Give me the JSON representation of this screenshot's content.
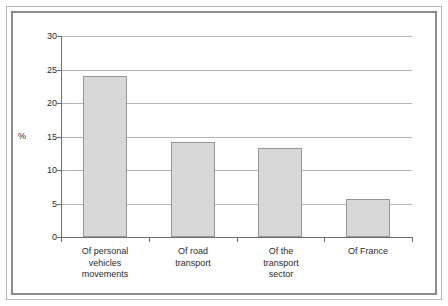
{
  "chart_data": {
    "type": "bar",
    "title": "",
    "subtitle": "",
    "xlabel": "",
    "ylabel": "%",
    "categories": [
      "Of personal vehicles movements",
      "Of road transport",
      "Of the transport sector",
      "Of France"
    ],
    "category_lines": [
      [
        "Of personal",
        "vehicles",
        "movements"
      ],
      [
        "Of road",
        "transport"
      ],
      [
        "Of the",
        "transport",
        "sector"
      ],
      [
        "Of France"
      ]
    ],
    "values": [
      24.0,
      14.2,
      13.3,
      5.6
    ],
    "ylim": [
      0,
      30
    ],
    "ytick_values": [
      0,
      5,
      10,
      15,
      20,
      25,
      30
    ],
    "ytick_labels": [
      "0",
      "5",
      "10",
      "15",
      "20",
      "25",
      "30"
    ],
    "grid": "horizontal",
    "legend": "none",
    "bar_color": "#d8d8d8",
    "bar_border_color": "#969696",
    "gridline_color": "#b4b4b4",
    "axis_color": "#6e6e6e",
    "frame_outer_color": "#b9b9b9",
    "frame_inner_color": "#8d8d8d",
    "background_color": "#ffffff",
    "text_color": "#2b2b2b"
  }
}
